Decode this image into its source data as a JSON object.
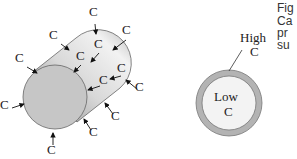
{
  "diagram": {
    "cylinder": {
      "labels": [
        {
          "text": "C",
          "x": 94,
          "y": 20,
          "ax1": 95,
          "ay1": 24,
          "ax2": 96,
          "ay2": 34
        },
        {
          "text": "C",
          "x": 54,
          "y": 43,
          "ax1": 61,
          "ay1": 44,
          "ax2": 69,
          "ay2": 50
        },
        {
          "text": "C",
          "x": 127,
          "y": 38,
          "ax1": 126,
          "ay1": 40,
          "ax2": 113,
          "ay2": 50
        },
        {
          "text": "C",
          "x": 99,
          "y": 52,
          "ax1": 99,
          "ay1": 53,
          "ax2": 91,
          "ay2": 62
        },
        {
          "text": "C",
          "x": 81,
          "y": 64,
          "ax1": 81,
          "ay1": 65,
          "ax2": 74,
          "ay2": 72
        },
        {
          "text": "C",
          "x": 20,
          "y": 66,
          "ax1": 27,
          "ay1": 67,
          "ax2": 37,
          "ay2": 73
        },
        {
          "text": "C",
          "x": 122,
          "y": 76,
          "ax1": 121,
          "ay1": 76,
          "ax2": 110,
          "ay2": 79
        },
        {
          "text": "C",
          "x": 104,
          "y": 88,
          "ax1": 100,
          "ay1": 86,
          "ax2": 88,
          "ay2": 90
        },
        {
          "text": "C",
          "x": 140,
          "y": 95,
          "ax1": 137,
          "ay1": 89,
          "ax2": 126,
          "ay2": 80
        },
        {
          "text": "C",
          "x": 5,
          "y": 113,
          "ax1": 12,
          "ay1": 108,
          "ax2": 24,
          "ay2": 104
        },
        {
          "text": "C",
          "x": 116,
          "y": 124,
          "ax1": 113,
          "ay1": 114,
          "ax2": 105,
          "ay2": 103
        },
        {
          "text": "C",
          "x": 94,
          "y": 140,
          "ax1": 91,
          "ay1": 130,
          "ax2": 84,
          "ay2": 119
        },
        {
          "text": "C",
          "x": 52,
          "y": 158,
          "ax1": 53,
          "ay1": 145,
          "ax2": 53,
          "ay2": 133
        }
      ]
    },
    "cross_section": {
      "outer_label_line1": "High",
      "outer_label_line2": "C",
      "inner_label_line1": "Low",
      "inner_label_line2": "C"
    },
    "caption_fragments": [
      "Fig",
      "Ca",
      "pr",
      "su"
    ],
    "colors": {
      "face": "#c9c9c9",
      "body_light": "#eeeeee",
      "body_dark": "#9a9a9a",
      "ring": "#b5b5b5",
      "core": "#f4f4f4",
      "stroke": "#555555"
    }
  }
}
